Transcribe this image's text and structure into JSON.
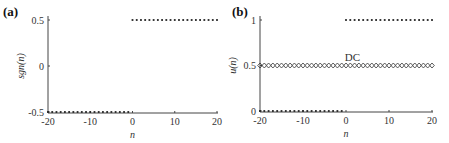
{
  "chart_data": [
    {
      "type": "scatter",
      "panel_label": "(a)",
      "xlabel": "n",
      "ylabel": "sgn(n)",
      "xlim": [
        -20,
        20
      ],
      "ylim": [
        -0.5,
        0.5
      ],
      "xticks": [
        "-20",
        "-10",
        "0",
        "10",
        "20"
      ],
      "yticks": [
        "-0.5",
        "0",
        "0.5"
      ],
      "series": [
        {
          "name": "sgn(n) n<0",
          "x_range": [
            -20,
            -1
          ],
          "value": -0.5,
          "marker": "dot"
        },
        {
          "name": "sgn(n) n>=0",
          "x_range": [
            0,
            20
          ],
          "value": 0.5,
          "marker": "dot"
        }
      ]
    },
    {
      "type": "scatter",
      "panel_label": "(b)",
      "xlabel": "n",
      "ylabel": "u(n)",
      "xlim": [
        -20,
        20
      ],
      "ylim": [
        0,
        1
      ],
      "xticks": [
        "-20",
        "-10",
        "0",
        "10",
        "20"
      ],
      "yticks": [
        "0",
        "0.5",
        "1"
      ],
      "annotation": "DC",
      "series": [
        {
          "name": "u(n) n<0",
          "x_range": [
            -20,
            -1
          ],
          "value": 0,
          "marker": "dot"
        },
        {
          "name": "u(n) n>=0",
          "x_range": [
            0,
            20
          ],
          "value": 1,
          "marker": "dot"
        },
        {
          "name": "DC",
          "x_range": [
            -20,
            20
          ],
          "value": 0.5,
          "marker": "diamond"
        }
      ]
    }
  ]
}
